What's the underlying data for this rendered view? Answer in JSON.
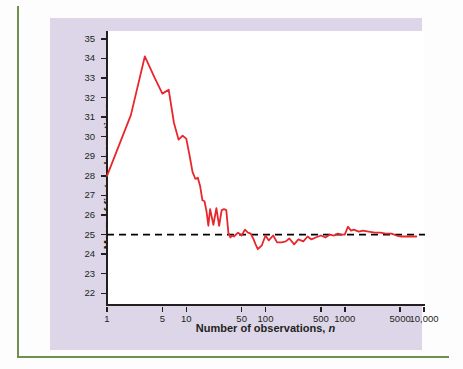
{
  "figure": {
    "background_color": "#dcd6e8",
    "plot_background_color": "#ffffff",
    "rule_color": "#6f9050",
    "axis_color": "#231f20"
  },
  "chart_data": {
    "type": "line",
    "title": "",
    "xlabel": "Number of observations, n",
    "ylabel": "Mean of first n observations",
    "xscale": "log",
    "xlim": [
      1,
      10000
    ],
    "ylim": [
      21.4,
      35.4
    ],
    "grid": false,
    "legend": null,
    "line_color": "#e8272c",
    "reference_line": {
      "value": 25,
      "style": "dashed",
      "color": "#000000",
      "label": ""
    },
    "xticks": [
      1,
      5,
      10,
      50,
      100,
      500,
      1000,
      5000,
      10000
    ],
    "xtick_labels": [
      "1",
      "5",
      "10",
      "50",
      "100",
      "500",
      "1000",
      "5000",
      "10,000"
    ],
    "yticks": [
      22,
      23,
      24,
      25,
      26,
      27,
      28,
      29,
      30,
      31,
      32,
      33,
      34,
      35
    ],
    "ytick_labels": [
      "22",
      "23",
      "24",
      "25",
      "26",
      "27",
      "28",
      "29",
      "30",
      "31",
      "32",
      "33",
      "34",
      "35"
    ],
    "series": [
      {
        "name": "Running mean of first n observations",
        "x": [
          1,
          2,
          3,
          4,
          5,
          6,
          7,
          8,
          9,
          10,
          11,
          12,
          13,
          14,
          15,
          16,
          17,
          18,
          19,
          20,
          22,
          24,
          26,
          28,
          30,
          32,
          34,
          36,
          38,
          40,
          45,
          50,
          55,
          60,
          65,
          70,
          75,
          80,
          90,
          100,
          110,
          125,
          140,
          160,
          180,
          200,
          230,
          260,
          300,
          340,
          380,
          430,
          500,
          570,
          650,
          730,
          820,
          900,
          1000,
          1100,
          1200,
          1300,
          1500,
          1700,
          2000,
          2400,
          2800,
          3300,
          3900,
          4500,
          5200,
          6000,
          7000,
          8000
        ],
        "y": [
          28.0,
          31.1,
          34.1,
          33.0,
          32.2,
          32.4,
          30.7,
          29.85,
          30.05,
          29.9,
          29.05,
          28.2,
          27.85,
          27.9,
          27.45,
          26.75,
          26.7,
          26.2,
          25.45,
          26.3,
          25.5,
          26.35,
          25.45,
          26.25,
          26.3,
          26.25,
          25.1,
          24.85,
          24.95,
          24.9,
          25.1,
          24.95,
          25.25,
          25.1,
          25.05,
          24.8,
          24.5,
          24.25,
          24.45,
          24.95,
          24.7,
          24.95,
          24.6,
          24.6,
          24.65,
          24.8,
          24.5,
          24.75,
          24.65,
          24.9,
          24.75,
          24.85,
          24.95,
          24.85,
          25.0,
          24.95,
          25.05,
          25.0,
          25.0,
          25.4,
          25.2,
          25.25,
          25.15,
          25.2,
          25.15,
          25.1,
          25.1,
          25.05,
          25.05,
          24.95,
          24.9,
          24.9,
          24.9,
          24.9
        ]
      }
    ]
  }
}
